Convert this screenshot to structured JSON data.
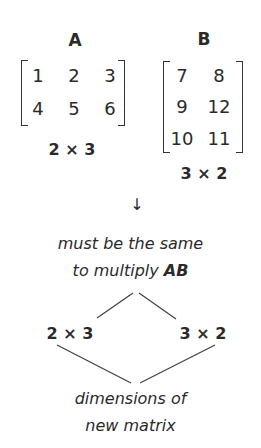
{
  "matrixA": {
    "label": "A",
    "rows": [
      [
        "1",
        "2",
        "3"
      ],
      [
        "4",
        "5",
        "6"
      ]
    ],
    "dims": "2 × 3"
  },
  "matrixB": {
    "label": "B",
    "rows": [
      [
        "7",
        "8"
      ],
      [
        "9",
        "12"
      ],
      [
        "10",
        "11"
      ]
    ],
    "dims": "3 × 2"
  },
  "arrow": "↓",
  "inner_note": {
    "line1": "must be the same",
    "line2_prefix": "to multiply ",
    "line2_bold": "AB"
  },
  "dims_row": {
    "left": "2 × 3",
    "right": "3 × 2"
  },
  "outer_note": {
    "line1": "dimensions of",
    "line2": "new matrix"
  }
}
